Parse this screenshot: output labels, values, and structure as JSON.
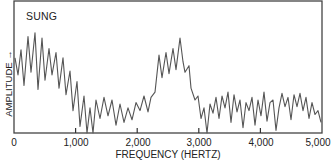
{
  "chart_data": {
    "type": "line",
    "title": "SUNG",
    "xlabel": "FREQUENCY (HERTZ)",
    "ylabel": "AMPLITUDE →",
    "xlim": [
      0,
      5000
    ],
    "ylim": [
      0,
      100
    ],
    "x_ticks": [
      0,
      1000,
      2000,
      3000,
      4000,
      5000
    ],
    "x_tick_labels": [
      "0",
      "1,000",
      "2,000",
      "3,000",
      "4,000",
      "5,000"
    ],
    "y_ticks": [],
    "grid": false,
    "legend": null,
    "series": [
      {
        "name": "sung spectrum",
        "color": "#555555",
        "points": [
          [
            16,
            57
          ],
          [
            65,
            44
          ],
          [
            114,
            63
          ],
          [
            162,
            36
          ],
          [
            227,
            73
          ],
          [
            276,
            46
          ],
          [
            341,
            76
          ],
          [
            390,
            33
          ],
          [
            455,
            72
          ],
          [
            503,
            40
          ],
          [
            568,
            64
          ],
          [
            617,
            44
          ],
          [
            682,
            61
          ],
          [
            731,
            34
          ],
          [
            795,
            57
          ],
          [
            844,
            29
          ],
          [
            909,
            47
          ],
          [
            958,
            17
          ],
          [
            1023,
            39
          ],
          [
            1071,
            5
          ],
          [
            1136,
            28
          ],
          [
            1185,
            0
          ],
          [
            1234,
            19
          ],
          [
            1282,
            0
          ],
          [
            1331,
            25
          ],
          [
            1396,
            11
          ],
          [
            1461,
            27
          ],
          [
            1526,
            13
          ],
          [
            1591,
            25
          ],
          [
            1656,
            6
          ],
          [
            1721,
            22
          ],
          [
            1786,
            8
          ],
          [
            1851,
            19
          ],
          [
            1916,
            10
          ],
          [
            1981,
            23
          ],
          [
            2045,
            17
          ],
          [
            2110,
            28
          ],
          [
            2175,
            16
          ],
          [
            2224,
            27
          ],
          [
            2289,
            31
          ],
          [
            2354,
            59
          ],
          [
            2403,
            42
          ],
          [
            2468,
            61
          ],
          [
            2516,
            45
          ],
          [
            2581,
            64
          ],
          [
            2630,
            48
          ],
          [
            2695,
            72
          ],
          [
            2744,
            54
          ],
          [
            2776,
            46
          ],
          [
            2841,
            51
          ],
          [
            2873,
            34
          ],
          [
            2938,
            25
          ],
          [
            2987,
            28
          ],
          [
            3036,
            11
          ],
          [
            3084,
            19
          ],
          [
            3133,
            0
          ],
          [
            3182,
            22
          ],
          [
            3231,
            15
          ],
          [
            3279,
            27
          ],
          [
            3328,
            11
          ],
          [
            3377,
            28
          ],
          [
            3425,
            19
          ],
          [
            3474,
            31
          ],
          [
            3523,
            8
          ],
          [
            3571,
            29
          ],
          [
            3620,
            16
          ],
          [
            3669,
            25
          ],
          [
            3718,
            4
          ],
          [
            3766,
            23
          ],
          [
            3815,
            17
          ],
          [
            3864,
            27
          ],
          [
            3912,
            6
          ],
          [
            3961,
            25
          ],
          [
            4010,
            13
          ],
          [
            4058,
            31
          ],
          [
            4107,
            9
          ],
          [
            4156,
            23
          ],
          [
            4204,
            25
          ],
          [
            4253,
            2
          ],
          [
            4302,
            19
          ],
          [
            4351,
            30
          ],
          [
            4399,
            20
          ],
          [
            4448,
            27
          ],
          [
            4497,
            10
          ],
          [
            4545,
            29
          ],
          [
            4594,
            20
          ],
          [
            4643,
            30
          ],
          [
            4692,
            17
          ],
          [
            4740,
            27
          ],
          [
            4789,
            11
          ],
          [
            4838,
            23
          ],
          [
            4886,
            14
          ],
          [
            4935,
            17
          ],
          [
            4984,
            8
          ]
        ]
      }
    ],
    "annotations": [
      "SUNG"
    ]
  }
}
